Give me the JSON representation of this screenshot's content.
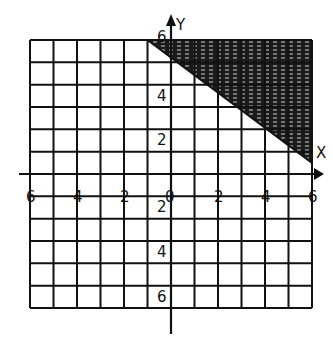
{
  "chart_data": {
    "type": "inequality-graph",
    "title": "",
    "xlabel": "X",
    "ylabel": "Y",
    "xlim": [
      -6,
      6
    ],
    "ylim": [
      -6,
      6
    ],
    "grid": true,
    "grid_step": 1,
    "x_tick_labels": [
      "-6",
      "-4",
      "-2",
      "0",
      "2",
      "4",
      "6"
    ],
    "x_tick_values": [
      -6,
      -4,
      -2,
      0,
      2,
      4,
      6
    ],
    "y_tick_labels_positive": [
      "6",
      "4",
      "2"
    ],
    "y_tick_values_positive": [
      6,
      4,
      2
    ],
    "y_tick_labels_negative": [
      "2",
      "4",
      "6"
    ],
    "y_tick_values_negative": [
      -2,
      -4,
      -6
    ],
    "origin_label": "0",
    "boundary_line": {
      "points": [
        [
          -1,
          6
        ],
        [
          6,
          0.5
        ]
      ],
      "style": "solid"
    },
    "shaded_region": {
      "description": "above the boundary line, upper-right corner of grid",
      "vertices": [
        [
          -1,
          6
        ],
        [
          6,
          6
        ],
        [
          6,
          0.5
        ]
      ],
      "fill": "crosshatch-dark"
    },
    "colors": {
      "grid": "#111111",
      "shade": "#1a1a1a",
      "background": "#ffffff"
    }
  }
}
